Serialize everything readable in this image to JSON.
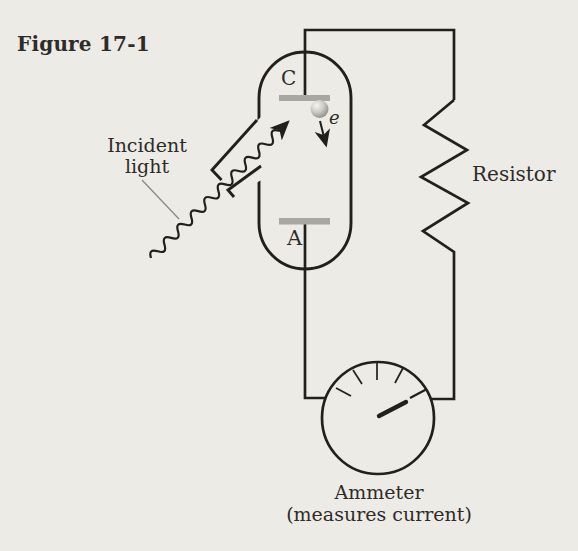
{
  "figure": {
    "title": "Figure 17-1"
  },
  "labels": {
    "incident_light": "Incident\nlight",
    "cathode": "C",
    "anode": "A",
    "electron": "e",
    "resistor": "Resistor",
    "ammeter": "Ammeter\n(measures current)"
  },
  "colors": {
    "paper": "#edebe6",
    "ink": "#21201c",
    "electrode_gray": "#a8a7a2",
    "pointer_gray": "#8b8a84"
  }
}
